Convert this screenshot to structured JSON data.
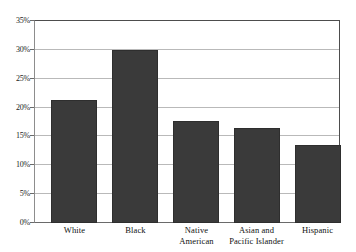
{
  "chart_data": {
    "type": "bar",
    "title": "",
    "subtitle": "",
    "xlabel": "",
    "ylabel": "",
    "categories": [
      "White",
      "Native American",
      "Black",
      "Asian and Pacific Islander",
      "Hispanic"
    ],
    "category_lines": [
      [
        "White"
      ],
      [
        "Black"
      ],
      [
        "Native",
        "American"
      ],
      [
        "Asian and",
        "Pacific Islander"
      ],
      [
        "Hispanic"
      ]
    ],
    "ordered_categories": [
      "White",
      "Black",
      "Native American",
      "Asian and Pacific Islander",
      "Hispanic"
    ],
    "values": [
      21.3,
      30.0,
      17.6,
      16.4,
      13.5
    ],
    "value_labels": [
      "21.3%",
      "30.0%",
      "17.6%",
      "16.4%",
      "13.5%"
    ],
    "ylim": [
      0,
      35
    ],
    "ytick_values": [
      0,
      5,
      10,
      15,
      20,
      25,
      30,
      35
    ],
    "ytick_labels": [
      "0%",
      "5%",
      "10%",
      "15%",
      "20%",
      "25%",
      "30%",
      "35%"
    ],
    "grid": true,
    "legend": false,
    "legend_position": "none",
    "bar_color": "#3a3a3a",
    "grid_color": "#b9b9b9",
    "frame_color": "#4d4d4d",
    "background_color": "#ffffff"
  }
}
